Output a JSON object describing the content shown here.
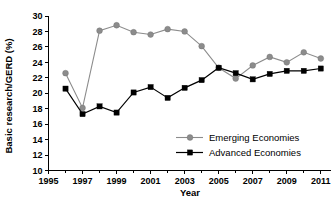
{
  "chart_data": {
    "type": "line",
    "title": "",
    "xlabel": "Year",
    "ylabel": "Basic research/GERD (%)",
    "xlim": [
      1995,
      2011.6
    ],
    "ylim": [
      10,
      30
    ],
    "x_tick_labels": [
      "1995",
      "1997",
      "1999",
      "2001",
      "2003",
      "2005",
      "2007",
      "2009",
      "2011"
    ],
    "x_tick_values": [
      1995,
      1997,
      1999,
      2001,
      2003,
      2005,
      2007,
      2009,
      2011
    ],
    "x_minor_ticks": [
      1996,
      1998,
      2000,
      2002,
      2004,
      2006,
      2008,
      2010
    ],
    "y_tick_labels": [
      "10",
      "12",
      "14",
      "16",
      "18",
      "20",
      "22",
      "24",
      "26",
      "28",
      "30"
    ],
    "y_tick_values": [
      10,
      12,
      14,
      16,
      18,
      20,
      22,
      24,
      26,
      28,
      30
    ],
    "grid": false,
    "legend_position": "center-right-inside",
    "x": [
      1996,
      1997,
      1998,
      1999,
      2000,
      2001,
      2002,
      2003,
      2004,
      2005,
      2006,
      2007,
      2008,
      2009,
      2010,
      2011
    ],
    "series": [
      {
        "name": "Emerging Economies",
        "color": "#8c8c8c",
        "marker": "circle",
        "values": [
          22.6,
          18.1,
          28.1,
          28.8,
          27.9,
          27.6,
          28.3,
          28.0,
          26.1,
          23.3,
          21.9,
          23.6,
          24.7,
          24.0,
          25.3,
          24.5
        ]
      },
      {
        "name": "Advanced Economies",
        "color": "#000000",
        "marker": "square",
        "values": [
          20.6,
          17.3,
          18.3,
          17.5,
          20.1,
          20.8,
          19.4,
          20.7,
          21.7,
          23.3,
          22.6,
          21.8,
          22.5,
          22.9,
          22.9,
          23.2
        ]
      }
    ]
  },
  "legend": {
    "entries": [
      {
        "label": "Emerging Economies"
      },
      {
        "label": "Advanced Economies"
      }
    ]
  }
}
